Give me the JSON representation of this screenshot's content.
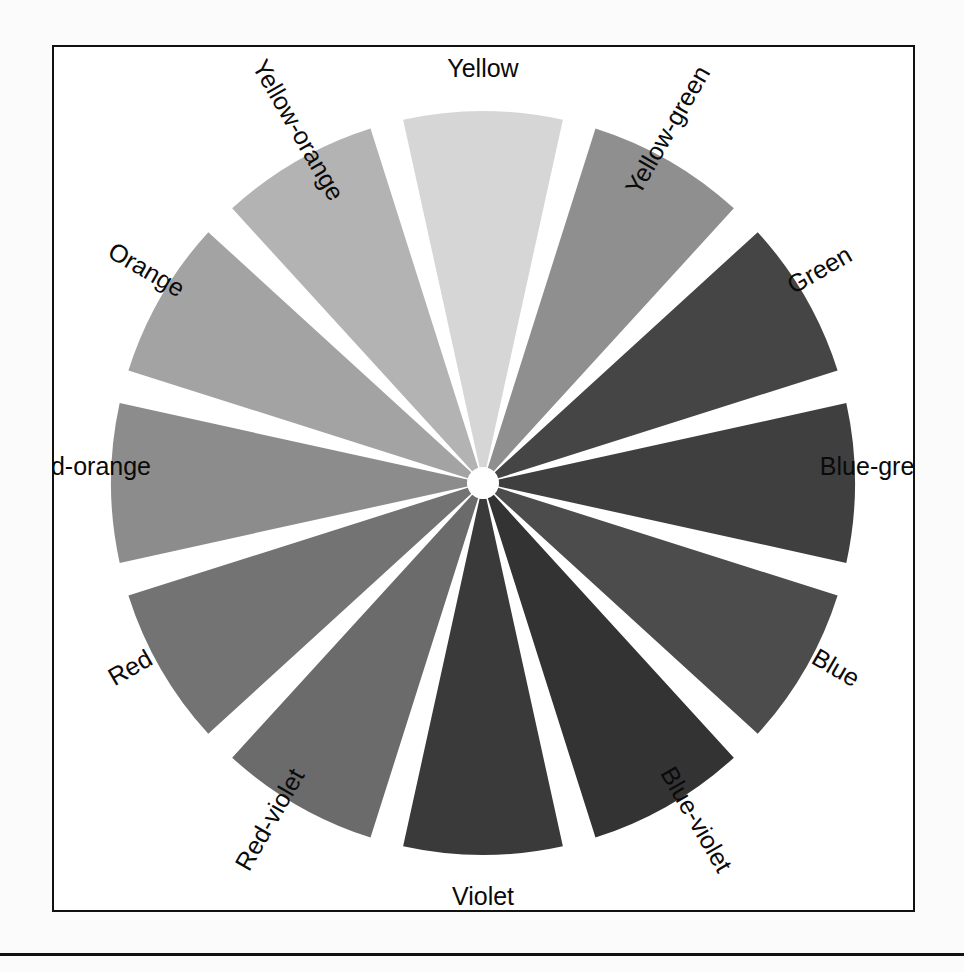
{
  "figure": {
    "kind": "color-wheel",
    "frame_color": "#111111",
    "background_color": "#ffffff",
    "gap_color": "#ffffff",
    "segment_count": 12
  },
  "chart_data": {
    "type": "pie",
    "title": "",
    "subtitle": "",
    "xlabel": "",
    "ylabel": "",
    "legend_position": "on-slice-perimeter",
    "grid": false,
    "categories": [
      "Yellow",
      "Yellow-green",
      "Green",
      "Blue-green",
      "Blue",
      "Blue-violet",
      "Violet",
      "Red-violet",
      "Red",
      "Red-orange",
      "Orange",
      "Yellow-orange"
    ],
    "values": [
      30,
      30,
      30,
      30,
      30,
      30,
      30,
      30,
      30,
      30,
      30,
      30
    ],
    "colors": [
      "#d6d6d6",
      "#8f8f8f",
      "#454545",
      "#3f3f3f",
      "#4c4c4c",
      "#333333",
      "#3a3a3a",
      "#6b6b6b",
      "#737373",
      "#8c8c8c",
      "#a3a3a3",
      "#b3b3b3"
    ]
  },
  "segments": [
    {
      "label": "Yellow",
      "color": "#d6d6d6",
      "mid_angle_deg": 0,
      "label_rotation_deg": 0
    },
    {
      "label": "Yellow-green",
      "color": "#8f8f8f",
      "mid_angle_deg": 30,
      "label_rotation_deg": 30
    },
    {
      "label": "Green",
      "color": "#454545",
      "mid_angle_deg": 60,
      "label_rotation_deg": 60
    },
    {
      "label": "Blue-green",
      "color": "#3f3f3f",
      "mid_angle_deg": 90,
      "label_rotation_deg": 90
    },
    {
      "label": "Blue",
      "color": "#4c4c4c",
      "mid_angle_deg": 120,
      "label_rotation_deg": 120
    },
    {
      "label": "Blue-violet",
      "color": "#333333",
      "mid_angle_deg": 150,
      "label_rotation_deg": 150
    },
    {
      "label": "Violet",
      "color": "#3a3a3a",
      "mid_angle_deg": 180,
      "label_rotation_deg": 0
    },
    {
      "label": "Red-violet",
      "color": "#6b6b6b",
      "mid_angle_deg": 210,
      "label_rotation_deg": -150
    },
    {
      "label": "Red",
      "color": "#737373",
      "mid_angle_deg": 240,
      "label_rotation_deg": -120
    },
    {
      "label": "Red-orange",
      "color": "#8c8c8c",
      "mid_angle_deg": 270,
      "label_rotation_deg": -90
    },
    {
      "label": "Orange",
      "color": "#a3a3a3",
      "mid_angle_deg": 300,
      "label_rotation_deg": -60
    },
    {
      "label": "Yellow-orange",
      "color": "#b3b3b3",
      "mid_angle_deg": 330,
      "label_rotation_deg": -30
    }
  ],
  "geometry": {
    "center_x": 431,
    "center_y": 438,
    "outer_radius": 372,
    "inner_radius": 16,
    "gap_degrees": 5.2,
    "label_radius": 398
  }
}
